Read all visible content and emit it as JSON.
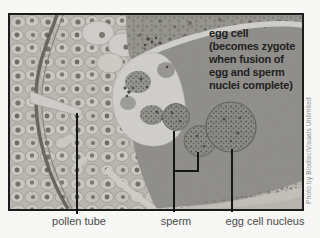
{
  "figure": {
    "annotation": {
      "lines": [
        "egg cell",
        "(becomes zygote",
        "when fusion of",
        "egg and sperm",
        "nuclei complete)"
      ]
    },
    "callouts": [
      {
        "id": "pollen-tube",
        "label": "pollen tube"
      },
      {
        "id": "sperm",
        "label": "sperm"
      },
      {
        "id": "egg-cell-nucleus",
        "label": "egg cell nucleus"
      }
    ],
    "credit": "Photo by Biodisc/Visuals Unlimited",
    "colors": {
      "leader_line": "#161616",
      "label_text": "#4b4b4b",
      "annotation_text": "#1f1f1f",
      "credit_text": "#8c8c8c",
      "photo_border": "#1c1c1c",
      "egg_cytoplasm": "#a9a8a3"
    }
  }
}
